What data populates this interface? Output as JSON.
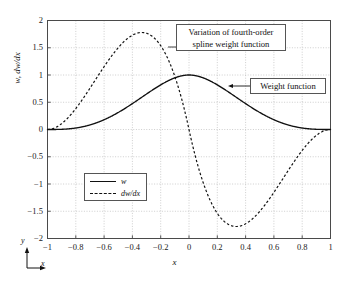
{
  "chart_data": {
    "type": "line",
    "title": "",
    "xlabel": "x",
    "ylabel": "w, dw/dx",
    "xlim": [
      -1,
      1
    ],
    "ylim": [
      -2,
      2
    ],
    "grid": true,
    "xticks": [
      "-1",
      "-0.8",
      "-0.6",
      "-0.4",
      "-0.2",
      "0",
      "0.2",
      "0.4",
      "0.6",
      "0.8",
      "1"
    ],
    "xtick_values": [
      -1,
      -0.8,
      -0.6,
      -0.4,
      -0.2,
      0,
      0.2,
      0.4,
      0.6,
      0.8,
      1
    ],
    "yticks": [
      "2",
      "1.5",
      "1",
      "0.5",
      "0",
      "-0.5",
      "-1",
      "-1.5",
      "-2"
    ],
    "ytick_values": [
      2,
      1.5,
      1,
      0.5,
      0,
      -0.5,
      -1,
      -1.5,
      -2
    ],
    "legend_position": "lower left inside",
    "series": [
      {
        "name": "w",
        "style": "solid",
        "color": "#111111",
        "x": [
          -1,
          -0.95,
          -0.9,
          -0.85,
          -0.8,
          -0.75,
          -0.7,
          -0.65,
          -0.6,
          -0.55,
          -0.5,
          -0.45,
          -0.4,
          -0.35,
          -0.3,
          -0.25,
          -0.2,
          -0.15,
          -0.1,
          -0.05,
          0,
          0.05,
          0.1,
          0.15,
          0.2,
          0.25,
          0.3,
          0.35,
          0.4,
          0.45,
          0.5,
          0.55,
          0.6,
          0.65,
          0.7,
          0.75,
          0.8,
          0.85,
          0.9,
          0.95,
          1
        ],
        "values": [
          0.0,
          0.0013,
          0.0052,
          0.0115,
          0.0202,
          0.0313,
          0.0448,
          0.0605,
          0.0784,
          0.0986,
          0.1208,
          0.1452,
          0.1715,
          0.1998,
          0.23,
          0.262,
          0.2958,
          0.3313,
          0.3684,
          0.407,
          0.4472,
          0.4888,
          0.5317,
          0.5759,
          0.6213,
          0.6678,
          0.7153,
          0.7638,
          0.8132,
          0.8634,
          0.9143,
          0.9659,
          1.0,
          0.9659,
          0.9143,
          0.8634,
          0.8132,
          0.7638,
          0.7153,
          0.6678,
          0.6213
        ]
      },
      {
        "name": "dw/dx",
        "style": "dashed",
        "color": "#111111",
        "peak_max": {
          "x": -0.31,
          "y": 1.78
        },
        "peak_min": {
          "x": 0.33,
          "y": -1.78
        },
        "zero_crossings": [
          -1,
          0,
          1
        ]
      }
    ],
    "annotations": [
      {
        "name": "title-callout",
        "text_line1": "Variation of fourth-order",
        "text_line2": "spline weight function"
      },
      {
        "name": "weight-function-callout",
        "text": "Weight function",
        "points_to_series": "w"
      }
    ],
    "axis_indicator": {
      "y": "y",
      "x": "x"
    }
  },
  "legend": {
    "entries": [
      {
        "label": "w",
        "style": "solid"
      },
      {
        "label": "dw/dx",
        "style": "dashed"
      }
    ]
  },
  "colors": {
    "curve": "#111111",
    "grid": "#b9b9b9",
    "frame": "#4a4a4a",
    "box_border": "#555555",
    "background": "#ffffff"
  }
}
